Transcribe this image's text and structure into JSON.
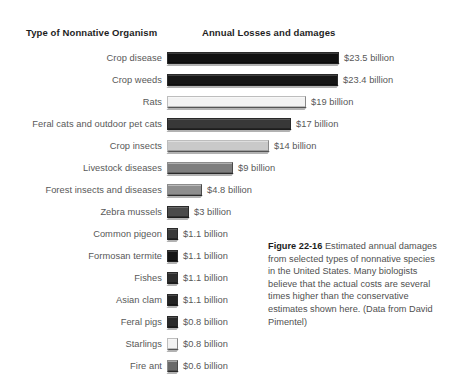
{
  "header": {
    "category_header": "Type of Nonnative Organism",
    "value_header": "Annual Losses and damages"
  },
  "caption": {
    "figure_number": "Figure 22-16",
    "text": " Estimated annual damages from selected types of nonnative species in the United States. Many biologists believe that the actual costs are several times higher than the conservative estimates shown here. (Data from David Pimentel)"
  },
  "chart_data": {
    "type": "bar",
    "orientation": "horizontal",
    "title": "Estimated annual damages from selected types of nonnative species in the United States",
    "xlabel": "Annual Losses and damages",
    "ylabel": "Type of Nonnative Organism",
    "unit": "billion US dollars",
    "grid": false,
    "legend": "none",
    "xlim": [
      0,
      23.5
    ],
    "categories": [
      "Crop disease",
      "Crop weeds",
      "Rats",
      "Feral cats and outdoor pet cats",
      "Crop insects",
      "Livestock diseases",
      "Forest insects and diseases",
      "Zebra mussels",
      "Common pigeon",
      "Formosan termite",
      "Fishes",
      "Asian clam",
      "Feral pigs",
      "Starlings",
      "Fire ant"
    ],
    "values": [
      23.5,
      23.4,
      19,
      17,
      14,
      9,
      4.8,
      3,
      1.1,
      1.1,
      1.1,
      1.1,
      0.8,
      0.8,
      0.6
    ],
    "value_labels": [
      "$23.5 billion",
      "$23.4 billion",
      "$19 billion",
      "$17 billion",
      "$14 billion",
      "$9 billion",
      "$4.8 billion",
      "$3 billion",
      "$1.1 billion",
      "$1.1 billion",
      "$1.1 billion",
      "$1.1 billion",
      "$0.8 billion",
      "$0.8 billion",
      "$0.6 billion"
    ],
    "bar_colors": [
      "#111111",
      "#161616",
      "#f2f2f2",
      "#383838",
      "#c9c9c9",
      "#7e7e7e",
      "#8e8e8e",
      "#4a4a4a",
      "#3a3a3a",
      "#151515",
      "#2e2e2e",
      "#232323",
      "#2a2a2a",
      "#f2f2f2",
      "#6a6a6a"
    ]
  }
}
